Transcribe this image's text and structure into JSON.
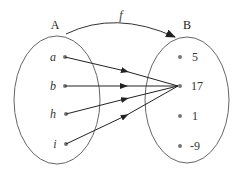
{
  "diagram": {
    "type": "function-mapping",
    "function_label": "f",
    "domain_set": {
      "label": "A",
      "elements": [
        "a",
        "b",
        "h",
        "i"
      ]
    },
    "codomain_set": {
      "label": "B",
      "elements": [
        "5",
        "17",
        "1",
        "-9"
      ]
    },
    "mappings": [
      {
        "from": "a",
        "to": "17"
      },
      {
        "from": "b",
        "to": "17"
      },
      {
        "from": "h",
        "to": "17"
      },
      {
        "from": "i",
        "to": "17"
      }
    ],
    "colors": {
      "stroke": "#555555",
      "arrow": "#222222",
      "dot": "#777777"
    }
  }
}
